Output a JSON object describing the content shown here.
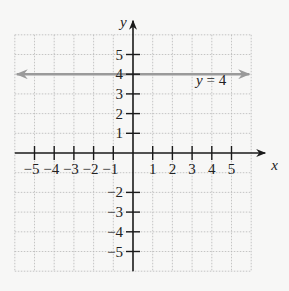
{
  "chart_data": {
    "type": "line",
    "title": "",
    "xlabel": "x",
    "ylabel": "y",
    "xlim": [
      -6,
      6
    ],
    "ylim": [
      -6,
      6
    ],
    "grid": true,
    "x_ticks": [
      -5,
      -4,
      -3,
      -2,
      -1,
      1,
      2,
      3,
      4,
      5
    ],
    "y_ticks": [
      -5,
      -4,
      -3,
      -2,
      1,
      2,
      3,
      4,
      5
    ],
    "x_tick_labels": [
      "−5",
      "−4",
      "−3",
      "−2",
      "−1",
      "1",
      "2",
      "3",
      "4",
      "5"
    ],
    "y_tick_labels": [
      "−5",
      "−4",
      "−3",
      "−2",
      "1",
      "2",
      "3",
      "4",
      "5"
    ],
    "series": [
      {
        "name": "y = 4",
        "equation": "y = 4",
        "x": [
          -6,
          6
        ],
        "y": [
          4,
          4
        ],
        "color": "#9a9a9a",
        "arrows": "both"
      }
    ],
    "annotations": [
      {
        "text": "y = 4",
        "x": 3.3,
        "y": 3.5
      }
    ]
  },
  "colors": {
    "background": "#f7f7f6",
    "axis": "#1a1a1a",
    "grid": "#b8b8b8",
    "line": "#9a9a9a"
  },
  "labels": {
    "x_axis": "x",
    "y_axis": "y",
    "line_label": "y = 4"
  }
}
